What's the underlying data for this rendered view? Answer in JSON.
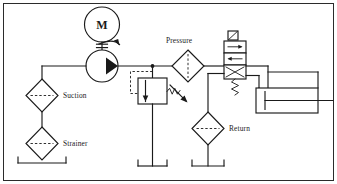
{
  "diagram": {
    "background_color": "#ffffff",
    "line_color": "#1a1a1a",
    "width": 337,
    "height": 184,
    "labels": {
      "motor": "M",
      "suction": "Suction",
      "strainer": "Strainer",
      "pressure": "Pressure",
      "return": "Return"
    },
    "components": [
      {
        "id": "electric-motor",
        "type": "electric-motor",
        "label": "M",
        "symbol": "circle-with-letter"
      },
      {
        "id": "hydraulic-pump",
        "type": "fixed-displacement-pump",
        "label": "",
        "symbol": "circle-with-solid-triangle"
      },
      {
        "id": "suction-filter",
        "type": "filter",
        "label": "Suction",
        "symbol": "diamond-dashed-horizontal"
      },
      {
        "id": "strainer-filter",
        "type": "strainer",
        "label": "Strainer",
        "symbol": "diamond-dashed-horizontal"
      },
      {
        "id": "pressure-filter",
        "type": "filter",
        "label": "Pressure",
        "symbol": "diamond-dashed-vertical"
      },
      {
        "id": "return-filter",
        "type": "filter",
        "label": "Return",
        "symbol": "diamond-dashed-horizontal"
      },
      {
        "id": "relief-valve",
        "type": "pressure-relief-valve",
        "label": "",
        "symbol": "box-arrow-spring-adjustable"
      },
      {
        "id": "directional-valve",
        "type": "directional-control-valve",
        "label": "",
        "symbol": "two-position-four-way-solenoid-spring"
      },
      {
        "id": "cylinder",
        "type": "single-rod-cylinder",
        "label": "",
        "symbol": "rectangle-piston-rod"
      },
      {
        "id": "reservoir-strainer",
        "type": "reservoir",
        "label": "",
        "symbol": "tank-open"
      },
      {
        "id": "reservoir-relief",
        "type": "reservoir",
        "label": "",
        "symbol": "tank-open"
      },
      {
        "id": "reservoir-return",
        "type": "reservoir",
        "label": "",
        "symbol": "tank-open"
      }
    ]
  }
}
